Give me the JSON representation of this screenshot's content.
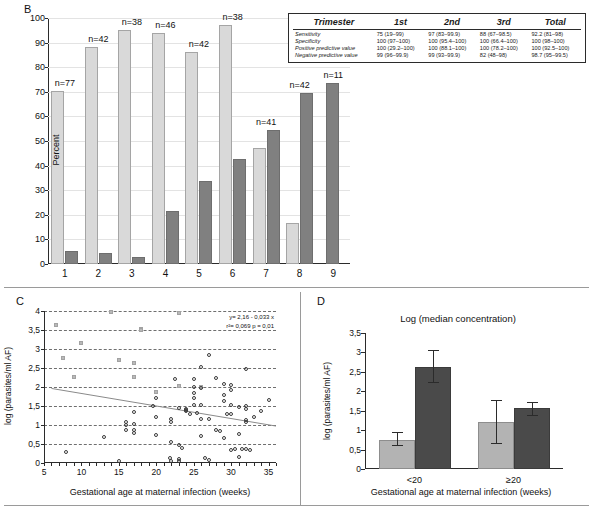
{
  "panels": {
    "b": {
      "letter": "B",
      "ylabel": "Percent",
      "yticks": [
        "100",
        "90",
        "80",
        "70",
        "60",
        "50",
        "40",
        "30",
        "20",
        "10",
        "0"
      ],
      "categories": [
        "1",
        "2",
        "3",
        "4",
        "5",
        "6",
        "7",
        "8",
        "9"
      ],
      "n_labels": [
        "n=77",
        "n=42",
        "n=38",
        "n=46",
        "n=42",
        "n=38",
        "n=41",
        "n=42",
        "n=11"
      ],
      "table": {
        "headers": [
          "Trimester",
          "1st",
          "2nd",
          "3rd",
          "Total"
        ],
        "rows": [
          {
            "name": "Sensitivity",
            "v1": "75 (19–99)",
            "v2": "97 (83–99.9)",
            "v3": "88 (67–98.5)",
            "v4": "92.2 (81–98)"
          },
          {
            "name": "Specificity",
            "v1": "100 (97–100)",
            "v2": "100 (95.4–100)",
            "v3": "100 (66.4–100)",
            "v4": "100 (98–100)"
          },
          {
            "name": "Positive predictive value",
            "v1": "100 (29.2–100)",
            "v2": "100 (88.1–100)",
            "v3": "100 (78.2–100)",
            "v4": "100 (92.5–100)"
          },
          {
            "name": "Negative predictive value",
            "v1": "99 (96–99.9)",
            "v2": "99 (93–99.9)",
            "v3": "82 (48–98)",
            "v4": "98.7 (95–99.5)"
          }
        ]
      }
    },
    "c": {
      "letter": "C",
      "ylabel": "log (parasites/ml AF)",
      "xlabel": "Gestational age at maternal infection (weeks)",
      "yticks": [
        "4",
        "3,5",
        "3",
        "2,5",
        "2",
        "1,5",
        "1",
        "0,5",
        "0"
      ],
      "xticks": [
        "5",
        "10",
        "15",
        "20",
        "25",
        "30",
        "35"
      ],
      "annotation_line1": "y= 2,16 - 0,033 x",
      "annotation_line2": "r²= 0,069 p = 0,01"
    },
    "d": {
      "letter": "D",
      "title": "Log (median concentration)",
      "ylabel": "log (parasites/ml AF)",
      "xlabel": "Gestational age at maternal infection (weeks)",
      "yticks": [
        "3,5",
        "3",
        "2,5",
        "2",
        "1,5",
        "1",
        "0,5",
        "0"
      ],
      "groups": [
        "<20",
        "≥20"
      ]
    }
  },
  "colors": {
    "bar_light": "#d9d9d9",
    "bar_dark": "#808080",
    "d_bar_light": "#b3b3b3",
    "d_bar_dark": "#4a4a4a",
    "axis": "#2b2b2b",
    "grid": "#e3e3e3"
  },
  "chart_data": [
    {
      "type": "bar",
      "panel": "B",
      "title": "",
      "xlabel": "",
      "ylabel": "Percent",
      "ylim": [
        0,
        100
      ],
      "grid": true,
      "legend": "none",
      "categories": [
        "1",
        "2",
        "3",
        "4",
        "5",
        "6",
        "7",
        "8",
        "9"
      ],
      "group_n": [
        77,
        42,
        38,
        46,
        42,
        38,
        41,
        42,
        11
      ],
      "series": [
        {
          "name": "light",
          "values": [
            70.3,
            88.3,
            95.3,
            94.0,
            86.0,
            97.0,
            47.0,
            16.8,
            null
          ]
        },
        {
          "name": "dark",
          "values": [
            5.2,
            4.5,
            2.8,
            21.5,
            33.7,
            42.5,
            54.5,
            69.5,
            73.5
          ]
        }
      ]
    },
    {
      "type": "scatter",
      "panel": "C",
      "title": "",
      "xlabel": "Gestational age at maternal infection (weeks)",
      "ylabel": "log (parasites/ml AF)",
      "xlim": [
        5,
        36
      ],
      "ylim": [
        0,
        4
      ],
      "grid": true,
      "regression": {
        "slope": -0.033,
        "intercept": 2.16,
        "r2": 0.069,
        "p": 0.01,
        "label": "y= 2,16 - 0,033 x  r²= 0,069 p = 0,01"
      },
      "series": [
        {
          "name": "filled",
          "x": [
            6.6,
            7.6,
            9.0,
            10.0,
            14.0,
            15.0,
            17.0,
            17.0,
            18.0,
            18.0,
            20.0,
            23.0,
            23.0,
            26.0
          ],
          "y": [
            3.62,
            2.76,
            2.27,
            3.17,
            3.98,
            2.7,
            2.63,
            2.26,
            3.52,
            3.5,
            1.86,
            3.95,
            2.02,
            2.0
          ]
        },
        {
          "name": "open",
          "x": [
            8.0,
            13.0,
            15.0,
            16.0,
            16.0,
            16.0,
            17.0,
            17.0,
            17.0,
            17.0,
            19.5,
            20.0,
            20.0,
            20.0,
            21.8,
            22.0,
            22.0,
            22.0,
            22.0,
            22.5,
            23.0,
            23.0,
            23.0,
            23.0,
            23.5,
            24.0,
            24.0,
            24.0,
            24.5,
            25.0,
            25.0,
            25.0,
            25.0,
            25.0,
            25.5,
            26.0,
            26.0,
            26.0,
            26.0,
            26.0,
            26.5,
            27.0,
            27.0,
            27.0,
            28.0,
            28.0,
            28.5,
            29.0,
            29.0,
            29.0,
            29.0,
            29.5,
            30.0,
            30.0,
            30.0,
            30.0,
            30.0,
            30.5,
            31.0,
            31.0,
            31.0,
            31.5,
            32.0,
            32.0,
            32.0,
            32.0,
            32.0,
            32.0,
            32.5,
            33.0,
            34.0,
            35.0
          ],
          "y": [
            0.28,
            0.68,
            0.04,
            1.08,
            1.0,
            0.88,
            1.35,
            1.02,
            0.88,
            0.78,
            1.5,
            1.7,
            1.22,
            0.74,
            0.12,
            1.15,
            1.07,
            0.55,
            0.04,
            2.21,
            1.45,
            0.47,
            0.1,
            0.04,
            0.4,
            1.42,
            1.38,
            1.4,
            1.3,
            2.22,
            2.0,
            1.85,
            1.7,
            1.52,
            1.32,
            2.53,
            1.98,
            1.52,
            1.15,
            0.72,
            0.14,
            2.84,
            1.15,
            0.08,
            2.23,
            0.88,
            0.84,
            2.08,
            1.78,
            1.62,
            0.66,
            1.3,
            2.06,
            1.92,
            1.52,
            1.28,
            0.35,
            0.38,
            1.48,
            0.76,
            0.16,
            0.38,
            2.47,
            1.5,
            1.42,
            1.14,
            1.08,
            0.36,
            0.34,
            1.22,
            1.38,
            1.66
          ]
        }
      ]
    },
    {
      "type": "bar",
      "panel": "D",
      "title": "Log (median concentration)",
      "xlabel": "Gestational age at maternal infection (weeks)",
      "ylabel": "log (parasites/ml AF)",
      "ylim": [
        0,
        3.5
      ],
      "grid": false,
      "categories": [
        "<20",
        "≥20"
      ],
      "series": [
        {
          "name": "light",
          "values": [
            0.75,
            1.22
          ],
          "err_low": [
            0.13,
            0.55
          ],
          "err_high": [
            0.2,
            0.55
          ]
        },
        {
          "name": "dark",
          "values": [
            2.63,
            1.56
          ],
          "err_low": [
            0.4,
            0.17
          ],
          "err_high": [
            0.43,
            0.17
          ]
        }
      ]
    }
  ]
}
